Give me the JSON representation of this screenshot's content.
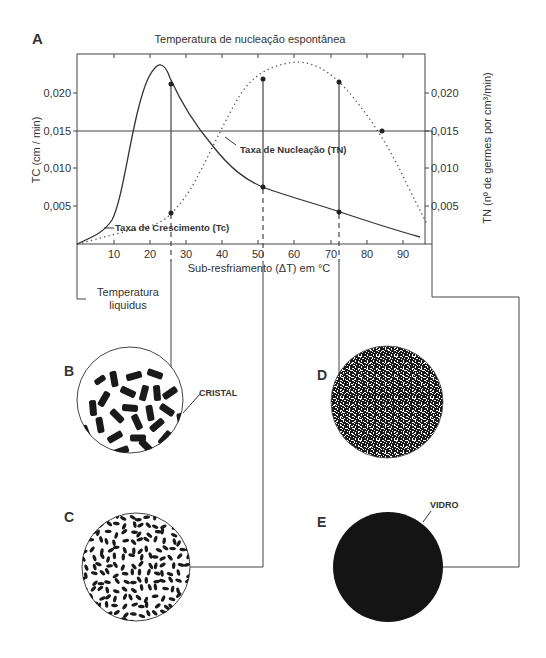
{
  "panel_a": {
    "letter": "A",
    "title": "Temperatura de nucleação espontânea",
    "left_axis_label": "TC (cm / min)",
    "right_axis_label": "TN (nº de germes por cm³/min)",
    "x_axis_label": "Sub-resfriamento (ΔT) em °C",
    "liquidus_label_line1": "Temperatura",
    "liquidus_label_line2": "liquidus",
    "growth_curve_label": "Taxa de Crescimento (Tc)",
    "nucleation_curve_label": "Taxa de Nucleação (TN)",
    "y_ticks": [
      "0,020",
      "0,015",
      "0,010",
      "0,005"
    ],
    "x_ticks": [
      "10",
      "20",
      "30",
      "40",
      "50",
      "60",
      "70",
      "80",
      "90"
    ]
  },
  "panel_b": {
    "letter": "B",
    "label": "CRISTAL"
  },
  "panel_c": {
    "letter": "C"
  },
  "panel_d": {
    "letter": "D"
  },
  "panel_e": {
    "letter": "E",
    "label": "VIDRO"
  },
  "chart_data": {
    "type": "line",
    "title": "Temperatura de nucleação espontânea",
    "xlabel": "Sub-resfriamento (ΔT) em °C",
    "ylabel": "TC (cm / min)",
    "ylabel_right": "TN (nº de germes por cm³/min)",
    "xlim": [
      0,
      97
    ],
    "ylim": [
      0,
      0.025
    ],
    "x_ticks": [
      10,
      20,
      30,
      40,
      50,
      60,
      70,
      80,
      90
    ],
    "y_ticks": [
      0.005,
      0.01,
      0.015,
      0.02
    ],
    "series": [
      {
        "name": "Taxa de Crescimento (Tc)",
        "style": "solid",
        "x": [
          0,
          5,
          10,
          15,
          18,
          20,
          22,
          24,
          26,
          30,
          35,
          40,
          45,
          51,
          60,
          72,
          80,
          90,
          96
        ],
        "values": [
          0.0,
          0.0012,
          0.003,
          0.008,
          0.015,
          0.0195,
          0.0218,
          0.022,
          0.0212,
          0.017,
          0.013,
          0.0105,
          0.009,
          0.0076,
          0.0063,
          0.0045,
          0.0033,
          0.0018,
          0.001
        ]
      },
      {
        "name": "Taxa de Nucleação (TN)",
        "style": "dotted",
        "x": [
          0,
          10,
          20,
          26,
          30,
          35,
          40,
          45,
          51,
          55,
          61,
          67,
          72,
          78,
          84,
          90,
          96
        ],
        "values": [
          0.0,
          0.0015,
          0.0035,
          0.0043,
          0.006,
          0.01,
          0.015,
          0.019,
          0.0218,
          0.0227,
          0.0231,
          0.0227,
          0.0215,
          0.019,
          0.015,
          0.009,
          0.003
        ]
      }
    ],
    "reference_lines": [
      {
        "type": "horizontal",
        "y": 0.015
      },
      {
        "type": "vertical",
        "x": 26,
        "label": "B"
      },
      {
        "type": "vertical",
        "x": 51,
        "label": "C"
      },
      {
        "type": "vertical",
        "x": 72,
        "label": "D"
      },
      {
        "type": "vertical",
        "x": 97,
        "label": "E"
      }
    ],
    "annotations": [
      "Temperatura liquidus",
      "Taxa de Crescimento (Tc)",
      "Taxa de Nucleação (TN)"
    ]
  }
}
